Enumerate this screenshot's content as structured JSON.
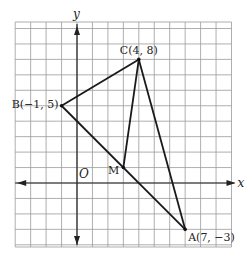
{
  "diagram": {
    "type": "coordinate-plane-triangle",
    "axes": {
      "x_label": "x",
      "y_label": "y",
      "origin_label": "O"
    },
    "grid": {
      "x_min": -4,
      "x_max": 10,
      "y_min": -4,
      "y_max": 10
    },
    "points": [
      {
        "name": "A",
        "label": "A(7, −3)",
        "x": 7,
        "y": -3
      },
      {
        "name": "B",
        "label": "B(−1, 5)",
        "x": -1,
        "y": 5
      },
      {
        "name": "C",
        "label": "C(4, 8)",
        "x": 4,
        "y": 8
      },
      {
        "name": "M",
        "label": "M",
        "x": 3,
        "y": 1
      }
    ],
    "segments": [
      [
        "B",
        "C"
      ],
      [
        "C",
        "A"
      ],
      [
        "A",
        "B"
      ],
      [
        "C",
        "M"
      ]
    ],
    "colors": {
      "grid": "#9a9a9a",
      "lines": "#1a1a1a",
      "background": "#ffffff"
    }
  }
}
